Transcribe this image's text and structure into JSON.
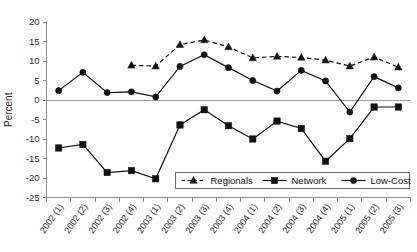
{
  "chart_data": {
    "type": "line",
    "title": "",
    "xlabel": "",
    "ylabel": "Percent",
    "ylim": [
      -25,
      20
    ],
    "ytick_step": 5,
    "yticks": [
      20,
      15,
      10,
      5,
      0,
      -5,
      -10,
      -15,
      -20,
      -25
    ],
    "ytick_labels": [
      "20",
      "15",
      "10",
      "5",
      "0",
      "-5",
      "-10",
      "-15",
      "-20",
      "-25"
    ],
    "grid": false,
    "legend_position": "bottom-center-inside",
    "zero_line": true,
    "categories": [
      "2002 (1)",
      "2002 (2)",
      "2002 (3)",
      "2002 (4)",
      "2003 (1)",
      "2003 (2)",
      "2003 (3)",
      "2003 (4)",
      "2004 (1)",
      "2004 (2)",
      "2004 (3)",
      "2004 (4)",
      "2005 (1)",
      "2005 (2)",
      "2005 (3)"
    ],
    "series": [
      {
        "name": "Regionals",
        "marker": "triangle",
        "line_style": "dashed",
        "color": "#111111",
        "values": [
          null,
          null,
          null,
          8.9,
          8.7,
          14.2,
          15.4,
          13.6,
          10.8,
          11.2,
          10.9,
          10.2,
          8.7,
          11.0,
          8.4
        ]
      },
      {
        "name": "Network",
        "marker": "square",
        "line_style": "solid",
        "color": "#111111",
        "values": [
          -12.3,
          -11.4,
          -18.6,
          -18.1,
          -20.2,
          -6.4,
          -2.5,
          -6.6,
          -10.0,
          -5.4,
          -7.3,
          -15.7,
          -9.9,
          -1.8,
          -1.8
        ]
      },
      {
        "name": "Low-Cost",
        "marker": "circle",
        "line_style": "solid",
        "color": "#111111",
        "values": [
          2.4,
          7.1,
          1.9,
          2.1,
          0.8,
          8.6,
          11.6,
          8.3,
          5.0,
          2.3,
          7.6,
          4.9,
          -3.1,
          6.0,
          3.1
        ]
      }
    ]
  },
  "legend": {
    "entries": [
      {
        "label": "Regionals"
      },
      {
        "label": "Network"
      },
      {
        "label": "Low-Cost"
      }
    ]
  },
  "axis": {
    "y_title": "Percent"
  }
}
